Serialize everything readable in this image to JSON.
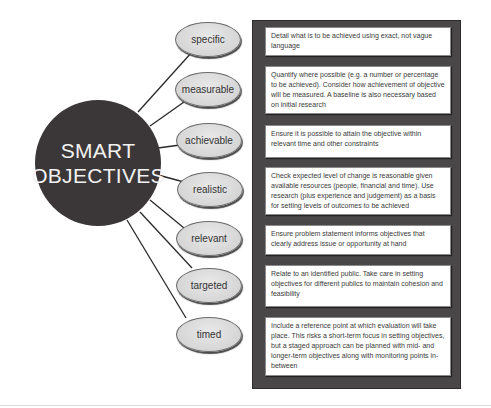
{
  "title": {
    "line1": "SMART",
    "line2": "OBJECTIVES"
  },
  "colors": {
    "hub": "#3b3738",
    "panel": "#4a4748",
    "pill": "#d6d6d6",
    "card": "#ffffff"
  },
  "criteria": [
    {
      "label": "specific",
      "description": "Detail what is to be achieved using exact, not vague language"
    },
    {
      "label": "measurable",
      "description": "Quantify where possible (e.g. a number or percentage to be achieved). Consider how achievement of objective will be measured. A baseline is also necessary based on initial research"
    },
    {
      "label": "achievable",
      "description": "Ensure it is possible to attain the objective within relevant time and other constraints"
    },
    {
      "label": "realistic",
      "description": "Check expected level of change is reasonable given available resources (people, financial and time). Use research (plus experience and judgement) as a basis for setting levels of outcomes to be achieved"
    },
    {
      "label": "relevant",
      "description": "Ensure problem statement informs objectives that clearly address issue or opportunity at hand"
    },
    {
      "label": "targeted",
      "description": "Relate to an identified public. Take care in setting objectives for different publics to maintain cohesion and feasibility"
    },
    {
      "label": "timed",
      "description": "Include a reference point at which evaluation will take place. This risks a short-term focus in setting objectives, but a staged approach can be planned with mid- and longer-term objectives along with monitoring points in-between"
    }
  ]
}
